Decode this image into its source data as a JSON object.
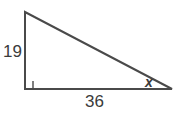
{
  "figure": {
    "type": "right-triangle-geometry-diagram",
    "background_color": "#ffffff",
    "stroke_color": "#4a4a4a",
    "text_color": "#3b3b3b",
    "vertical_leg_label": "19",
    "horizontal_leg_label": "36",
    "angle_label": "x",
    "right_angle_marker": "right-angle-square",
    "geometry": {
      "top_vertex": [
        25,
        12
      ],
      "right_angle_vertex": [
        25,
        89
      ],
      "right_vertex": [
        172,
        89
      ],
      "right_angle_marker_size": 8
    }
  }
}
